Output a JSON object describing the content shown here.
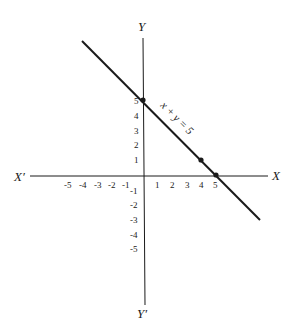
{
  "diagram": {
    "axes": {
      "x_positive_label": "X",
      "x_negative_label": "X′",
      "y_positive_label": "Y",
      "y_negative_label": "Y′"
    },
    "x_ticks": [
      "-5",
      "-4",
      "-3",
      "-2",
      "-1",
      "1",
      "2",
      "3",
      "4",
      "5"
    ],
    "y_ticks": [
      "5",
      "4",
      "3",
      "2",
      "1",
      "-1",
      "-2",
      "-3",
      "-4",
      "-5"
    ],
    "line": {
      "equation_label": "x + y = 5"
    },
    "points": [
      {
        "x": 0,
        "y": 5
      },
      {
        "x": 4,
        "y": 1
      },
      {
        "x": 5,
        "y": 0
      }
    ],
    "colors": {
      "ink": "#1a1a1a",
      "background": "#ffffff"
    }
  }
}
